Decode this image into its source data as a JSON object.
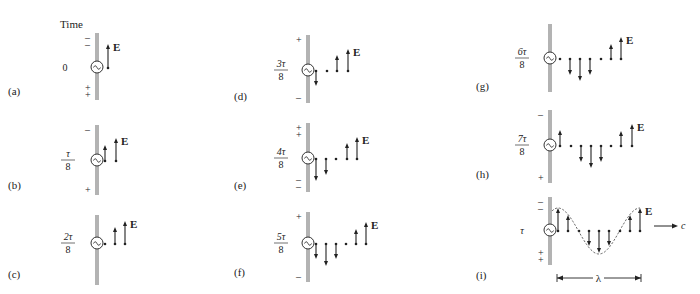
{
  "figure": {
    "time_header": "Time",
    "field_label": "E",
    "wavelength_label": "λ",
    "speed_label": "c",
    "panels": [
      {
        "id": "a",
        "label": "(a)",
        "time_num": "0",
        "time_den": "",
        "top_signs": "– –",
        "bottom_signs": "+ +",
        "vectors": [
          {
            "dx": 11,
            "v": 24
          }
        ]
      },
      {
        "id": "b",
        "label": "(b)",
        "time_num": "τ",
        "time_den": "8",
        "top_signs": "–",
        "bottom_signs": "+",
        "vectors": [
          {
            "dx": 8,
            "v": 16
          },
          {
            "dx": 19,
            "v": 23
          }
        ]
      },
      {
        "id": "c",
        "label": "(c)",
        "time_num": "2τ",
        "time_den": "8",
        "top_signs": "",
        "bottom_signs": "",
        "vectors": [
          {
            "dx": 8,
            "v": 0
          },
          {
            "dx": 18,
            "v": 17
          },
          {
            "dx": 28,
            "v": 23
          }
        ]
      },
      {
        "id": "d",
        "label": "(d)",
        "time_num": "3τ",
        "time_den": "8",
        "top_signs": "+",
        "bottom_signs": "–",
        "vectors": [
          {
            "dx": 8,
            "v": -15
          },
          {
            "dx": 19,
            "v": 0
          },
          {
            "dx": 29,
            "v": 16
          },
          {
            "dx": 40,
            "v": 22
          }
        ]
      },
      {
        "id": "e",
        "label": "(e)",
        "time_num": "4τ",
        "time_den": "8",
        "top_signs": "+ +",
        "bottom_signs": "– –",
        "vectors": [
          {
            "dx": 8,
            "v": -22
          },
          {
            "dx": 18,
            "v": -16
          },
          {
            "dx": 28,
            "v": 0
          },
          {
            "dx": 39,
            "v": 16
          },
          {
            "dx": 49,
            "v": 22
          }
        ]
      },
      {
        "id": "f",
        "label": "(f)",
        "time_num": "5τ",
        "time_den": "8",
        "top_signs": "+",
        "bottom_signs": "–",
        "vectors": [
          {
            "dx": 8,
            "v": -15
          },
          {
            "dx": 18,
            "v": -22
          },
          {
            "dx": 28,
            "v": -15
          },
          {
            "dx": 38,
            "v": 0
          },
          {
            "dx": 48,
            "v": 15
          },
          {
            "dx": 58,
            "v": 22
          }
        ]
      },
      {
        "id": "g",
        "label": "(g)",
        "time_num": "6τ",
        "time_den": "8",
        "top_signs": "",
        "bottom_signs": "",
        "vectors": [
          {
            "dx": 10,
            "v": 0
          },
          {
            "dx": 20,
            "v": -16
          },
          {
            "dx": 30,
            "v": -22
          },
          {
            "dx": 40,
            "v": -16
          },
          {
            "dx": 51,
            "v": 0
          },
          {
            "dx": 61,
            "v": 15
          },
          {
            "dx": 71,
            "v": 22
          }
        ]
      },
      {
        "id": "h",
        "label": "(h)",
        "time_num": "7τ",
        "time_den": "8",
        "top_signs": "–",
        "bottom_signs": "+",
        "vectors": [
          {
            "dx": 10,
            "v": 16
          },
          {
            "dx": 21,
            "v": 0
          },
          {
            "dx": 31,
            "v": -16
          },
          {
            "dx": 41,
            "v": -22
          },
          {
            "dx": 51,
            "v": -16
          },
          {
            "dx": 61,
            "v": 0
          },
          {
            "dx": 71,
            "v": 15
          },
          {
            "dx": 82,
            "v": 22
          }
        ]
      },
      {
        "id": "i",
        "label": "(i)",
        "time_num": "τ",
        "time_den": "",
        "top_signs": "– –",
        "bottom_signs": "+ +",
        "vectors": [
          {
            "dx": 8,
            "v": 23
          },
          {
            "dx": 18,
            "v": 16
          },
          {
            "dx": 29,
            "v": 0
          },
          {
            "dx": 39,
            "v": -15
          },
          {
            "dx": 49,
            "v": -22
          },
          {
            "dx": 59,
            "v": -15
          },
          {
            "dx": 70,
            "v": 0
          },
          {
            "dx": 80,
            "v": 16
          },
          {
            "dx": 90,
            "v": 23
          }
        ]
      }
    ]
  }
}
